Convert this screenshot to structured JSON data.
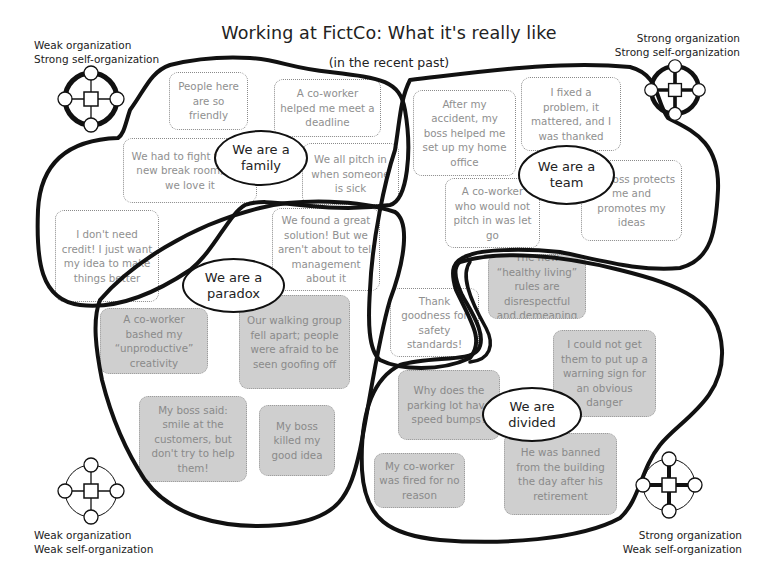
{
  "header": {
    "title": "Working at FictCo: What it's really like",
    "subtitle": "(in the recent past)"
  },
  "corners": {
    "top_left": {
      "line1": "Weak organization",
      "line2": "Strong self-organization",
      "icon": "network-weak-org-strong-self-icon"
    },
    "top_right": {
      "line1": "Strong organization",
      "line2": "Strong self-organization",
      "icon": "network-strong-org-strong-self-icon"
    },
    "bottom_left": {
      "line1": "Weak organization",
      "line2": "Weak self-organization",
      "icon": "network-weak-org-weak-self-icon"
    },
    "bottom_right": {
      "line1": "Strong organization",
      "line2": "Weak self-organization",
      "icon": "network-strong-org-weak-self-icon"
    }
  },
  "clusters": [
    {
      "id": "family",
      "label": "We are a family"
    },
    {
      "id": "team",
      "label": "We are a team"
    },
    {
      "id": "paradox",
      "label": "We are a paradox"
    },
    {
      "id": "divided",
      "label": "We are divided"
    }
  ],
  "stories": [
    {
      "id": "s1",
      "text": "People here are so friendly",
      "tone": "positive"
    },
    {
      "id": "s2",
      "text": "A co-worker helped me meet a deadline",
      "tone": "positive"
    },
    {
      "id": "s3",
      "text": "We had to fight for our new break room, but we love it",
      "tone": "positive"
    },
    {
      "id": "s4",
      "text": "We all pitch in when someone is sick",
      "tone": "positive"
    },
    {
      "id": "s5",
      "text": "I don't need credit! I just want my idea to make things better",
      "tone": "positive"
    },
    {
      "id": "s6",
      "text": "We found a great solution! But we aren't about to tell management about it",
      "tone": "positive"
    },
    {
      "id": "s7",
      "text": "After my accident, my boss helped me set up my home office",
      "tone": "positive"
    },
    {
      "id": "s8",
      "text": "I fixed a problem, it mattered, and I was thanked",
      "tone": "positive"
    },
    {
      "id": "s9",
      "text": "A co-worker who would not pitch in was let go",
      "tone": "positive"
    },
    {
      "id": "s10",
      "text": "My boss protects me and promotes my ideas",
      "tone": "positive"
    },
    {
      "id": "s11",
      "text": "Thank goodness for safety standards!",
      "tone": "positive"
    },
    {
      "id": "s12",
      "text": "A co-worker bashed my “unproductive” creativity",
      "tone": "negative"
    },
    {
      "id": "s13",
      "text": "Our walking group fell apart; people were afraid to be seen goofing off",
      "tone": "negative"
    },
    {
      "id": "s14",
      "text": "My boss said: smile at the customers, but don't try to help them!",
      "tone": "negative"
    },
    {
      "id": "s15",
      "text": "My boss killed my good idea",
      "tone": "negative"
    },
    {
      "id": "s16",
      "text": "The new “healthy living” rules are disrespectful and demeaning",
      "tone": "negative"
    },
    {
      "id": "s17",
      "text": "I could not get them to put up a warning sign for an obvious danger",
      "tone": "negative"
    },
    {
      "id": "s18",
      "text": "Why does the parking lot have speed bumps?",
      "tone": "negative"
    },
    {
      "id": "s19",
      "text": "My co-worker was fired for no reason",
      "tone": "negative"
    },
    {
      "id": "s20",
      "text": "He was banned from the building the day after his retirement",
      "tone": "negative"
    }
  ],
  "colors": {
    "outline": "#111111",
    "story_text": "#8f8f8f",
    "story_border": "#8a8a8a",
    "negative_fill": "#cfcfcf",
    "title_text": "#222222"
  }
}
